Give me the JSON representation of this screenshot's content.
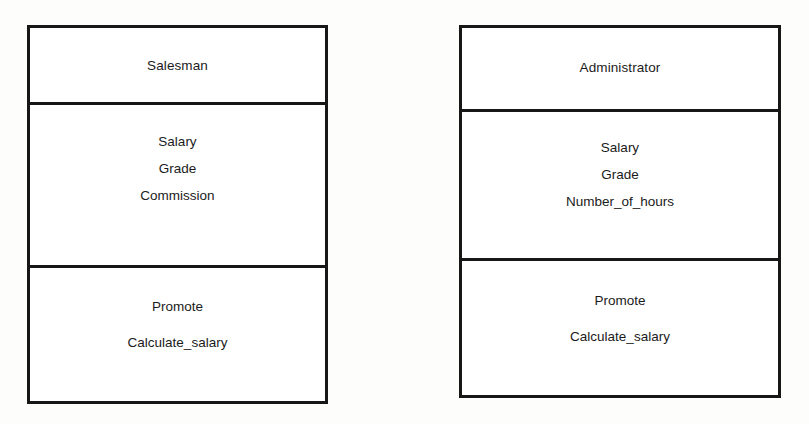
{
  "diagram": {
    "type": "uml-class-diagram",
    "background_color": "#fdfdfc",
    "border_color": "#171717",
    "text_color": "#1b1b1b",
    "classes": [
      {
        "id": "salesman",
        "name": "Salesman",
        "attributes": [
          "Salary",
          "Grade",
          "Commission"
        ],
        "operations": [
          "Promote",
          "Calculate_salary"
        ]
      },
      {
        "id": "administrator",
        "name": "Administrator",
        "attributes": [
          "Salary",
          "Grade",
          "Number_of_hours"
        ],
        "operations": [
          "Promote",
          "Calculate_salary"
        ]
      }
    ]
  }
}
